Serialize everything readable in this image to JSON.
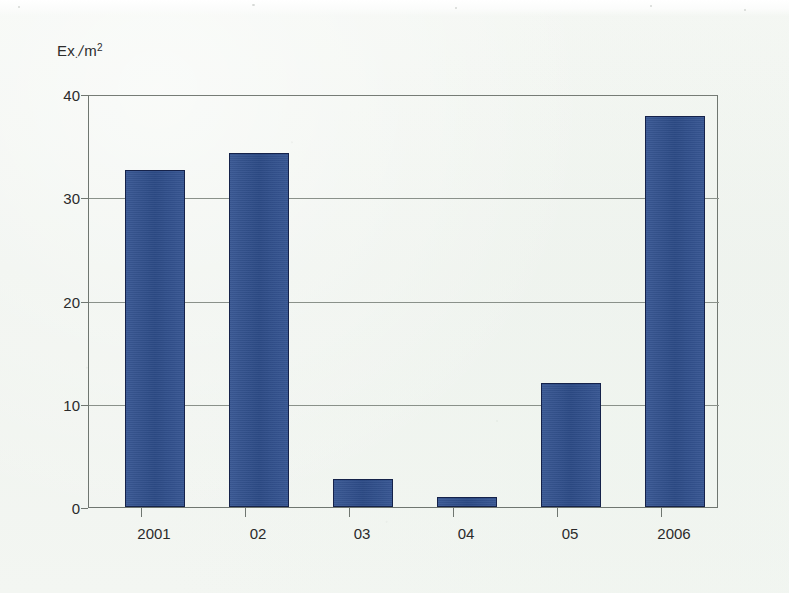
{
  "chart_data": {
    "type": "bar",
    "title": "",
    "subtitle": "",
    "xlabel": "",
    "ylabel": "Ex./m²",
    "ylabel_parts": {
      "base": "Ex",
      "subscript": ".",
      "slash": "/",
      "unit": "m",
      "exponent": "2"
    },
    "categories": [
      "2001",
      "02",
      "03",
      "04",
      "05",
      "2006"
    ],
    "values": [
      32.8,
      34.5,
      2.7,
      1.0,
      12.1,
      38.1
    ],
    "series": [
      {
        "name": "Ex./m²",
        "values": [
          32.8,
          34.5,
          2.7,
          1.0,
          12.1,
          38.1
        ]
      }
    ],
    "ylim": [
      0,
      40
    ],
    "y_ticks": [
      "0",
      "10",
      "20",
      "30",
      "40"
    ],
    "y_tick_values": [
      0,
      10,
      20,
      30,
      40
    ],
    "grid": true,
    "grid_axis": "y",
    "legend": false,
    "legend_position": "none",
    "bar_color": "#2f4f8e",
    "bar_border_color": "#15224a",
    "grid_color": "#8a918a",
    "axis_color": "#6f7670",
    "background_color": "#f2f5f1",
    "text_color": "#2b2b2b"
  }
}
